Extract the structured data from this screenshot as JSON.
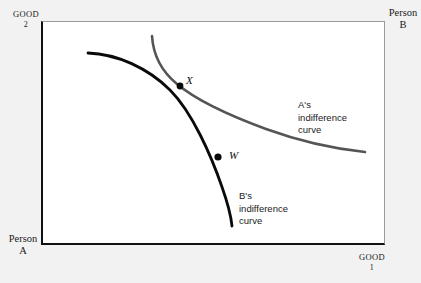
{
  "figure": {
    "background_color": "#f2f2f2",
    "plot_background_color": "#ffffff"
  },
  "axes": {
    "top_left": {
      "line1": "GOOD",
      "line2": "2"
    },
    "top_right": {
      "line1": "Person",
      "line2": "B"
    },
    "bottom_left": {
      "line1": "Person",
      "line2": "A"
    },
    "bottom_right": {
      "line1": "GOOD",
      "line2": "1"
    }
  },
  "annotations": {
    "curve_a": {
      "line1": "A's",
      "line2": "indifference",
      "line3": "curve"
    },
    "curve_b": {
      "line1": "B's",
      "line2": "indifference",
      "line3": "curve"
    }
  },
  "points": {
    "x": {
      "label": "X"
    },
    "w": {
      "label": "W"
    }
  },
  "chart_data": {
    "type": "line",
    "xlabel": "GOOD 1",
    "ylabel": "GOOD 2",
    "grid": false,
    "legend": "inline-annotations",
    "plot_area_px": {
      "x": 41,
      "y": 21,
      "width": 344,
      "height": 224
    },
    "series": [
      {
        "name": "A's indifference curve",
        "color": "#555555",
        "width_px": 2.6,
        "points_px": [
          [
            152,
            36
          ],
          [
            156,
            48
          ],
          [
            161,
            60
          ],
          [
            168,
            72
          ],
          [
            177,
            83
          ],
          [
            188,
            93
          ],
          [
            202,
            103
          ],
          [
            218,
            112
          ],
          [
            236,
            120
          ],
          [
            256,
            127
          ],
          [
            278,
            133
          ],
          [
            300,
            138
          ],
          [
            322,
            143
          ],
          [
            344,
            148
          ],
          [
            365,
            152
          ]
        ]
      },
      {
        "name": "B's indifference curve",
        "color": "#0a0a0a",
        "width_px": 2.8,
        "points_px": [
          [
            88,
            53
          ],
          [
            104,
            55
          ],
          [
            119,
            59
          ],
          [
            134,
            65
          ],
          [
            148,
            72
          ],
          [
            161,
            81
          ],
          [
            172,
            92
          ],
          [
            182,
            104
          ],
          [
            191,
            118
          ],
          [
            199,
            133
          ],
          [
            207,
            149
          ],
          [
            214,
            165
          ],
          [
            221,
            182
          ],
          [
            226,
            198
          ],
          [
            230,
            212
          ],
          [
            232,
            226
          ]
        ]
      }
    ],
    "markers": [
      {
        "label": "X",
        "x_px": 180,
        "y_px": 86,
        "style": "intersection",
        "filled": true
      },
      {
        "label": "W",
        "x_px": 218,
        "y_px": 157,
        "style": "dot",
        "filled": true
      }
    ]
  },
  "colors": {
    "curve_a": "#555555",
    "curve_b": "#0a0a0a",
    "frame_dark": "#111111",
    "frame_light": "#9a9a9a",
    "page_background": "#f2f2f2"
  }
}
